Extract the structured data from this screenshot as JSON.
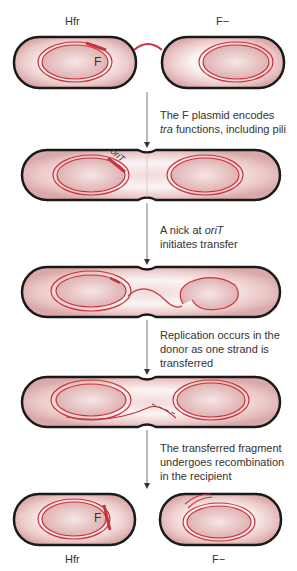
{
  "labels": {
    "top_left": "Hfr",
    "top_right": "F−",
    "bottom_left": "Hfr",
    "bottom_right": "F−",
    "plasmid_top": "F",
    "plasmid_bottom": "F",
    "orit": "oriT"
  },
  "steps": [
    {
      "line1": "The F plasmid encodes",
      "line2_italic": "tra",
      "line2_rest": " functions, including pili"
    },
    {
      "line1_pre": "A nick at ",
      "line1_italic": "oriT",
      "line2": "initiates transfer"
    },
    {
      "line1": "Replication occurs in the",
      "line2": "donor as one strand is",
      "line3": "transferred"
    },
    {
      "line1": "The transferred fragment",
      "line2": "undergoes recombination",
      "line3": "in the recipient"
    }
  ],
  "colors": {
    "cell_outline": "#1a1a1a",
    "dna": "#c8343c",
    "cell_fill": "#e8c4c4",
    "nucleoid_fill": "#dca8a8"
  }
}
